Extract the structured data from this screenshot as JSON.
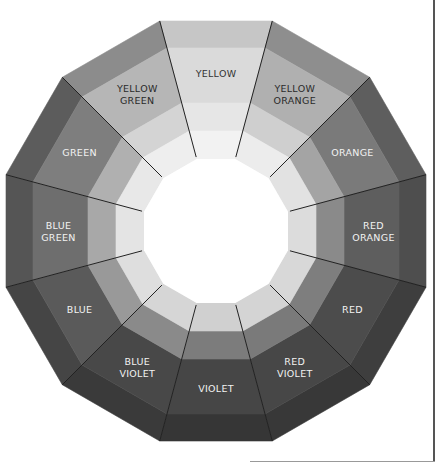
{
  "wheel": {
    "center": [
      216,
      231
    ],
    "ring_apothems": [
      210,
      183,
      128,
      100,
      72
    ],
    "segments": [
      {
        "name": "yellow",
        "lines": [
          "YELLOW"
        ],
        "shades": [
          "#c6c6c6",
          "#dadada",
          "#e6e6e6",
          "#f2f2f2"
        ],
        "text_color": "#333333"
      },
      {
        "name": "yellow-orange",
        "lines": [
          "YELLOW",
          "ORANGE"
        ],
        "shades": [
          "#8e8e8e",
          "#b0b0b0",
          "#cfcfcf",
          "#ececec"
        ],
        "text_color": "#2a2a2a"
      },
      {
        "name": "orange",
        "lines": [
          "ORANGE"
        ],
        "shades": [
          "#5e5e5e",
          "#7a7a7a",
          "#a4a4a4",
          "#e2e2e2"
        ],
        "text_color": "#f2f2f2"
      },
      {
        "name": "red-orange",
        "lines": [
          "RED",
          "ORANGE"
        ],
        "shades": [
          "#4e4e4e",
          "#5e5e5e",
          "#8a8a8a",
          "#dcdcdc"
        ],
        "text_color": "#f2f2f2"
      },
      {
        "name": "red",
        "lines": [
          "RED"
        ],
        "shades": [
          "#3e3e3e",
          "#4c4c4c",
          "#7e7e7e",
          "#d8d8d8"
        ],
        "text_color": "#f2f2f2"
      },
      {
        "name": "red-violet",
        "lines": [
          "RED",
          "VIOLET"
        ],
        "shades": [
          "#383838",
          "#474747",
          "#7a7a7a",
          "#d4d4d4"
        ],
        "text_color": "#f2f2f2"
      },
      {
        "name": "violet",
        "lines": [
          "VIOLET"
        ],
        "shades": [
          "#363636",
          "#464646",
          "#7c7c7c",
          "#d0d0d0"
        ],
        "text_color": "#f2f2f2"
      },
      {
        "name": "blue-violet",
        "lines": [
          "BLUE",
          "VIOLET"
        ],
        "shades": [
          "#3a3a3a",
          "#484848",
          "#8a8a8a",
          "#d6d6d6"
        ],
        "text_color": "#f2f2f2"
      },
      {
        "name": "blue",
        "lines": [
          "BLUE"
        ],
        "shades": [
          "#454545",
          "#5a5a5a",
          "#999999",
          "#dedede"
        ],
        "text_color": "#f2f2f2"
      },
      {
        "name": "blue-green",
        "lines": [
          "BLUE",
          "GREEN"
        ],
        "shades": [
          "#555555",
          "#6e6e6e",
          "#a8a8a8",
          "#e4e4e4"
        ],
        "text_color": "#f2f2f2"
      },
      {
        "name": "green",
        "lines": [
          "GREEN"
        ],
        "shades": [
          "#5c5c5c",
          "#7e7e7e",
          "#b0b0b0",
          "#e8e8e8"
        ],
        "text_color": "#f2f2f2"
      },
      {
        "name": "yellow-green",
        "lines": [
          "YELLOW",
          "GREEN"
        ],
        "shades": [
          "#8c8c8c",
          "#b6b6b6",
          "#d4d4d4",
          "#eeeeee"
        ],
        "text_color": "#2a2a2a"
      }
    ],
    "divider_color": "#222222",
    "center_color": "#ffffff"
  }
}
